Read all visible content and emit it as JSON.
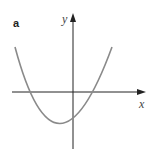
{
  "panel": {
    "label": "a"
  },
  "axes": {
    "x_label": "x",
    "y_label": "y"
  },
  "curve": {
    "type": "parabola",
    "opens": "up",
    "color": "#8a8a8a",
    "vertex_position": "below x-axis, slightly left of y-axis",
    "roots": 2
  },
  "colors": {
    "axis": "#222222",
    "curve": "#8a8a8a"
  }
}
